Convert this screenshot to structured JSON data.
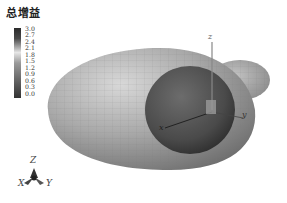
{
  "colorbar": {
    "title": "总增益",
    "ticks": [
      "3.0",
      "2.7",
      "2.4",
      "2.1",
      "1.8",
      "1.5",
      "1.2",
      "0.9",
      "0.6",
      "0.3",
      "0.0"
    ]
  },
  "plot_axes": {
    "x_label": "x",
    "y_label": "y",
    "z_label": "z"
  },
  "orientation_triad": {
    "x_label": "X",
    "y_label": "Y",
    "z_label": "Z"
  },
  "colors": {
    "outer_surface": "#a8a8a8",
    "inner_sphere": "#555555",
    "axis_line": "#333333"
  }
}
